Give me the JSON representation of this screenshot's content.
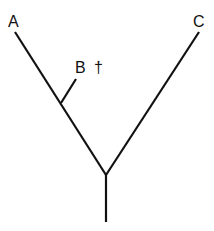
{
  "diagram": {
    "type": "cladogram",
    "line_color": "#111111",
    "background": "#ffffff",
    "taxa": [
      {
        "id": "A",
        "label": "A",
        "extinct": false
      },
      {
        "id": "B",
        "label": "B",
        "extinct": true,
        "extinct_marker": "†"
      },
      {
        "id": "C",
        "label": "C",
        "extinct": false
      }
    ],
    "labels": {
      "a": "A",
      "b": "B",
      "b_dagger": "†",
      "c": "C"
    },
    "topology": "((A,B),C)"
  }
}
